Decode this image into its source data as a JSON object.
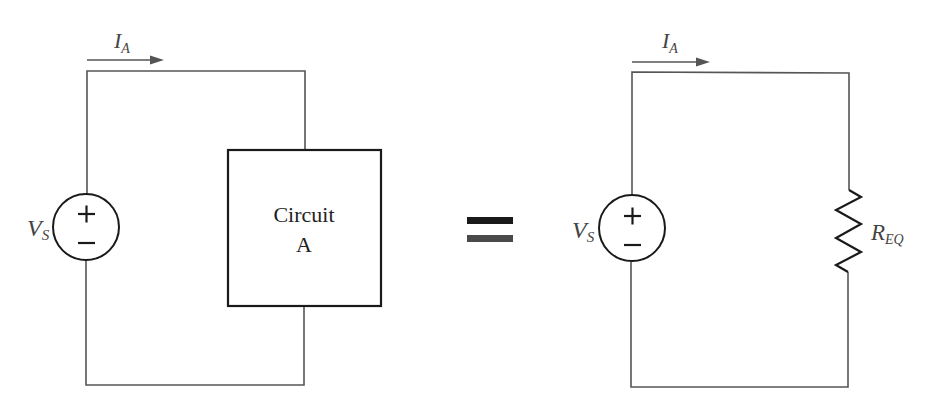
{
  "left_circuit": {
    "current_label": {
      "main": "I",
      "sub": "A"
    },
    "source_label": {
      "main": "V",
      "sub": "S"
    },
    "source_plus": "+",
    "source_minus": "−",
    "box_label_line1": "Circuit",
    "box_label_line2": "A"
  },
  "equals": {
    "top_color": "#1a1a1a",
    "bottom_color": "#4a4a4a"
  },
  "right_circuit": {
    "current_label": {
      "main": "I",
      "sub": "A"
    },
    "source_label": {
      "main": "V",
      "sub": "S"
    },
    "source_plus": "+",
    "source_minus": "−",
    "resistor_label": {
      "main": "R",
      "sub": "EQ"
    }
  },
  "colors": {
    "wire": "#555555",
    "outline": "#1a1a1a",
    "label": "#444444",
    "background": "#ffffff"
  }
}
